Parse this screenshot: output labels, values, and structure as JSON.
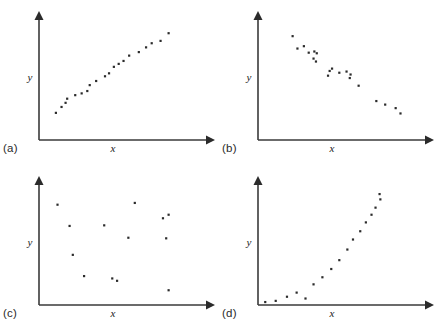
{
  "figure": {
    "title": "",
    "background_color": "#ffffff",
    "marker_color": "#2b2b2b",
    "axis_color": "#3a3a3a",
    "layout": "2x2 grid of scatterplots"
  },
  "panels": [
    {
      "caption": "(a)",
      "xlabel": "x",
      "ylabel": "y",
      "relationship": "strong positive linear correlation"
    },
    {
      "caption": "(b)",
      "xlabel": "x",
      "ylabel": "y",
      "relationship": "strong negative linear correlation"
    },
    {
      "caption": "(c)",
      "xlabel": "x",
      "ylabel": "y",
      "relationship": "no correlation"
    },
    {
      "caption": "(d)",
      "xlabel": "x",
      "ylabel": "y",
      "relationship": "curvilinear increasing relationship"
    }
  ],
  "chart_data": [
    {
      "type": "scatter",
      "title": "(a)",
      "xlabel": "x",
      "ylabel": "y",
      "xlim": [
        0,
        100
      ],
      "ylim": [
        0,
        100
      ],
      "grid": false,
      "legend": "none",
      "annotations": [
        "strong positive linear correlation"
      ],
      "points": [
        [
          10.5,
          23.0
        ],
        [
          14.0,
          28.0
        ],
        [
          16.5,
          31.5
        ],
        [
          17.5,
          35.0
        ],
        [
          22.5,
          38.0
        ],
        [
          26.5,
          39.5
        ],
        [
          30.0,
          41.5
        ],
        [
          31.5,
          46.5
        ],
        [
          35.5,
          50.0
        ],
        [
          41.0,
          54.0
        ],
        [
          43.5,
          56.5
        ],
        [
          46.5,
          62.0
        ],
        [
          49.5,
          64.5
        ],
        [
          52.5,
          67.0
        ],
        [
          56.0,
          71.5
        ],
        [
          62.0,
          74.5
        ],
        [
          66.5,
          78.5
        ],
        [
          70.0,
          82.0
        ],
        [
          75.5,
          84.0
        ],
        [
          80.5,
          90.5
        ]
      ]
    },
    {
      "type": "scatter",
      "title": "(b)",
      "xlabel": "x",
      "ylabel": "y",
      "xlim": [
        0,
        100
      ],
      "ylim": [
        0,
        100
      ],
      "grid": false,
      "legend": "none",
      "annotations": [
        "strong negative linear correlation"
      ],
      "points": [
        [
          21.5,
          88.0
        ],
        [
          24.5,
          77.5
        ],
        [
          28.5,
          79.5
        ],
        [
          31.5,
          74.0
        ],
        [
          35.0,
          75.0
        ],
        [
          36.5,
          73.5
        ],
        [
          34.5,
          69.0
        ],
        [
          36.0,
          66.5
        ],
        [
          44.5,
          58.5
        ],
        [
          46.0,
          60.5
        ],
        [
          43.5,
          54.5
        ],
        [
          50.5,
          57.0
        ],
        [
          55.0,
          58.0
        ],
        [
          57.5,
          55.5
        ],
        [
          57.0,
          52.5
        ],
        [
          62.5,
          46.0
        ],
        [
          73.5,
          33.0
        ],
        [
          79.0,
          30.0
        ],
        [
          85.5,
          27.0
        ],
        [
          88.5,
          22.5
        ]
      ]
    },
    {
      "type": "scatter",
      "title": "(c)",
      "xlabel": "x",
      "ylabel": "y",
      "xlim": [
        0,
        100
      ],
      "ylim": [
        0,
        100
      ],
      "grid": false,
      "legend": "none",
      "annotations": [
        "no correlation"
      ],
      "points": [
        [
          11.5,
          85.0
        ],
        [
          19.0,
          67.0
        ],
        [
          21.0,
          42.5
        ],
        [
          28.0,
          24.5
        ],
        [
          40.5,
          67.5
        ],
        [
          45.5,
          22.5
        ],
        [
          48.5,
          20.5
        ],
        [
          55.5,
          57.0
        ],
        [
          59.5,
          86.5
        ],
        [
          77.0,
          73.5
        ],
        [
          80.5,
          76.5
        ],
        [
          79.0,
          56.5
        ],
        [
          80.5,
          12.5
        ]
      ]
    },
    {
      "type": "scatter",
      "title": "(d)",
      "xlabel": "x",
      "ylabel": "y",
      "xlim": [
        0,
        100
      ],
      "ylim": [
        0,
        100
      ],
      "grid": false,
      "legend": "none",
      "annotations": [
        "curvilinear increasing relationship"
      ],
      "points": [
        [
          4.5,
          2.5
        ],
        [
          11.0,
          3.5
        ],
        [
          18.0,
          7.0
        ],
        [
          24.0,
          10.5
        ],
        [
          29.5,
          5.5
        ],
        [
          34.5,
          17.5
        ],
        [
          40.0,
          23.5
        ],
        [
          45.5,
          30.5
        ],
        [
          50.5,
          38.0
        ],
        [
          55.5,
          47.0
        ],
        [
          59.0,
          55.5
        ],
        [
          63.5,
          62.5
        ],
        [
          67.0,
          70.0
        ],
        [
          70.5,
          76.5
        ],
        [
          73.0,
          82.5
        ],
        [
          76.0,
          89.5
        ],
        [
          75.5,
          94.0
        ]
      ]
    }
  ]
}
